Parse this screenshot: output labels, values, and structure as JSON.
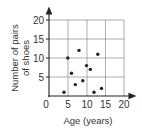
{
  "chart_data": {
    "type": "scatter",
    "title": "",
    "xlabel": "Age (years)",
    "ylabel_lines": [
      "Number of pairs",
      "of shoes"
    ],
    "ylabel": "Number of pairs of shoes",
    "xlim": [
      0,
      20
    ],
    "ylim": [
      0,
      20
    ],
    "x_ticks": [
      0,
      5,
      10,
      15,
      20
    ],
    "y_ticks": [
      5,
      10,
      15,
      20
    ],
    "grid": true,
    "legend": null,
    "points": [
      {
        "x": 4,
        "y": 1
      },
      {
        "x": 5,
        "y": 10
      },
      {
        "x": 6,
        "y": 6
      },
      {
        "x": 7,
        "y": 3
      },
      {
        "x": 8,
        "y": 12
      },
      {
        "x": 9,
        "y": 4
      },
      {
        "x": 10,
        "y": 8
      },
      {
        "x": 11,
        "y": 7
      },
      {
        "x": 12,
        "y": 1
      },
      {
        "x": 13,
        "y": 11
      },
      {
        "x": 14,
        "y": 2
      }
    ]
  },
  "labels": {
    "x_tick_0": "0",
    "x_tick_5": "5",
    "x_tick_10": "10",
    "x_tick_15": "15",
    "x_tick_20": "20",
    "y_tick_5": "5",
    "y_tick_10": "10",
    "y_tick_15": "15",
    "y_tick_20": "20",
    "xlabel": "Age (years)",
    "ylabel_line1": "Number of pairs",
    "ylabel_line2": "of shoes"
  },
  "colors": {
    "axis": "#222222",
    "grid": "#888888",
    "point": "#222222"
  }
}
